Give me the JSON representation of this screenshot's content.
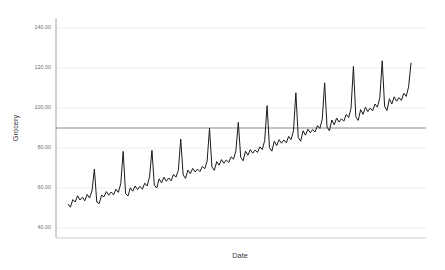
{
  "chart_data": {
    "type": "line",
    "title": "",
    "subtitle": "",
    "xlabel": "Date",
    "ylabel": "Grocery",
    "grid": true,
    "legend": false,
    "legend_position": "none",
    "xlim": [
      0,
      144
    ],
    "ylim": [
      35,
      145
    ],
    "yticks": [
      40,
      60,
      80,
      100,
      120,
      140
    ],
    "ytick_labels": [
      "40.00",
      "60.00",
      "80.00",
      "100.00",
      "120.00",
      "140.00"
    ],
    "xticks": [],
    "xtick_labels": [],
    "line_color": "#1a1a1a",
    "line_width": 1.0,
    "grid_color": "#e8e8e8",
    "axis_color": "#9a9a9a",
    "reference_line": {
      "value": 90,
      "orientation": "horizontal",
      "color": "#7d7d7d",
      "label": ""
    },
    "series": [
      {
        "name": "Grocery",
        "values": [
          52.0,
          50.4,
          54.2,
          53.0,
          56.1,
          54.0,
          55.4,
          53.6,
          56.8,
          55.0,
          58.6,
          69.5,
          53.0,
          52.2,
          56.4,
          55.6,
          58.2,
          56.4,
          58.0,
          56.6,
          59.4,
          57.8,
          62.2,
          78.3,
          57.2,
          56.0,
          60.1,
          58.4,
          61.0,
          59.2,
          60.8,
          59.4,
          62.4,
          61.0,
          65.6,
          78.8,
          61.4,
          60.0,
          64.6,
          62.6,
          65.4,
          63.4,
          65.0,
          63.6,
          66.8,
          65.4,
          68.8,
          84.5,
          66.6,
          64.8,
          69.0,
          67.2,
          69.8,
          68.0,
          69.4,
          68.2,
          70.8,
          69.6,
          73.4,
          89.9,
          70.6,
          68.8,
          73.2,
          71.4,
          74.2,
          72.4,
          74.0,
          72.8,
          75.6,
          74.4,
          78.6,
          92.8,
          75.4,
          73.6,
          78.4,
          76.4,
          79.2,
          77.4,
          79.0,
          77.8,
          80.6,
          79.2,
          83.8,
          101.2,
          80.2,
          78.4,
          83.4,
          81.2,
          84.2,
          82.4,
          84.0,
          82.6,
          85.8,
          84.2,
          88.6,
          107.6,
          85.2,
          83.4,
          88.6,
          86.4,
          89.4,
          87.6,
          89.2,
          88.0,
          91.2,
          89.8,
          94.4,
          112.6,
          90.4,
          88.6,
          94.0,
          91.6,
          95.0,
          93.0,
          94.6,
          93.4,
          96.8,
          95.2,
          99.8,
          120.8,
          95.6,
          93.8,
          99.2,
          96.8,
          100.4,
          98.2,
          100.0,
          98.6,
          102.0,
          100.4,
          105.2,
          123.6,
          100.8,
          98.8,
          104.6,
          102.0,
          105.6,
          103.4,
          105.2,
          103.8,
          107.4,
          105.8,
          110.6,
          122.6
        ]
      }
    ]
  },
  "axes": {
    "y_title": "Grocery",
    "x_title": "Date"
  }
}
